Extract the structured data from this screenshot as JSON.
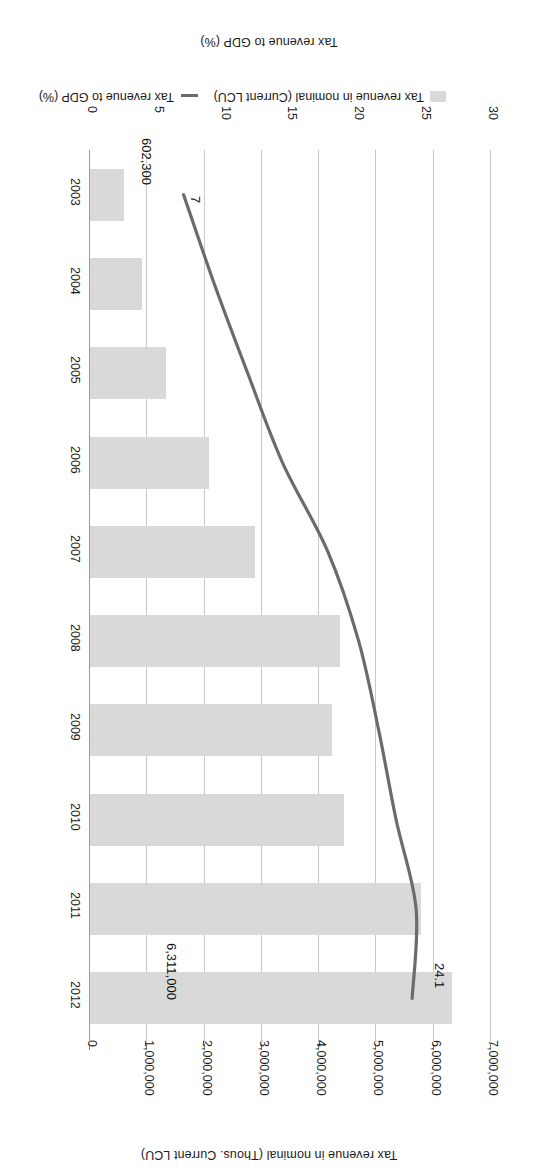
{
  "chart_data": {
    "type": "bar",
    "title": "",
    "subtitle": "",
    "orientation": "vertical-bars-with-overlay-line",
    "rotation_note": "figure is printed upside-down (180 degrees) in the scan",
    "categories": [
      "2003",
      "2004",
      "2005",
      "2006",
      "2007",
      "2008",
      "2009",
      "2010",
      "2011",
      "2012"
    ],
    "xlabel": "",
    "grid": true,
    "legend_position": "bottom",
    "series": [
      {
        "name": "Tax revenue in nominal (Current LCU)",
        "type": "bar",
        "axis": "primary",
        "axis_label": "Tax revenue in nominal (Thous. Current LCU)",
        "ylim": [
          0,
          7000000
        ],
        "yticks": [
          "0",
          "1,000,000",
          "2,000,000",
          "3,000,000",
          "4,000,000",
          "5,000,000",
          "6,000,000",
          "7,000,000"
        ],
        "ytick_values": [
          0,
          1000000,
          2000000,
          3000000,
          4000000,
          5000000,
          6000000,
          7000000
        ],
        "values": [
          602300,
          900000,
          1320000,
          2080000,
          2880000,
          4370000,
          4230000,
          4430000,
          5780000,
          6311000
        ],
        "color": "#d9d9d9",
        "data_labels": [
          {
            "category": "2003",
            "text": "602,300"
          },
          {
            "category": "2012",
            "text": "6,311,000"
          }
        ]
      },
      {
        "name": "Tax revenue to GDP (%)",
        "type": "line",
        "axis": "secondary",
        "axis_label": "Tax revenue to GDP (%)",
        "ylim": [
          0,
          30
        ],
        "yticks": [
          "0",
          "5",
          "10",
          "15",
          "20",
          "25",
          "30"
        ],
        "ytick_values": [
          0,
          5,
          10,
          15,
          20,
          25,
          30
        ],
        "values": [
          7.0,
          9.3,
          11.8,
          14.4,
          17.8,
          20.1,
          21.6,
          22.9,
          24.4,
          24.1
        ],
        "color": "#6b6b6b",
        "data_labels": [
          {
            "category": "2003",
            "text": "7"
          },
          {
            "category": "2012",
            "text": "24.1"
          }
        ]
      }
    ]
  },
  "axis": {
    "nominal_title": "Tax revenue in nominal (Thous. Current LCU)",
    "gdp_title": "Tax revenue to GDP (%)"
  },
  "legend": {
    "bar_label": "Tax revenue in nominal (Current LCU)",
    "line_label": "Tax revenue to GDP (%)",
    "bar_color": "#d9d9d9",
    "line_color": "#6b6b6b"
  },
  "labels": {
    "bar_2012": "6,311,000",
    "bar_2003": "602,300",
    "line_2012": "24.1",
    "line_2003": "7"
  }
}
